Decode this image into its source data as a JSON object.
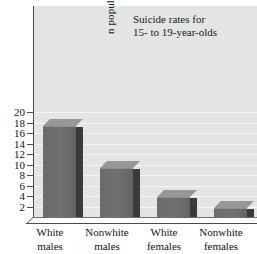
{
  "chart_data": {
    "type": "bar",
    "title": "Suicide rates for 15- to 19-year-olds",
    "title_line1": "Suicide rates for",
    "title_line2": "15- to 19-year-olds",
    "xlabel": "",
    "ylabel": "n population",
    "ylim": [
      0,
      20
    ],
    "ytick_step": 2,
    "grid": true,
    "legend": "none",
    "categories": [
      "White males",
      "Nonwhite males",
      "White females",
      "Nonwhite females"
    ],
    "category_lines": [
      [
        "White",
        "males"
      ],
      [
        "Nonwhite",
        "males"
      ],
      [
        "White",
        "females"
      ],
      [
        "Nonwhite",
        "females"
      ]
    ],
    "values": [
      18.4,
      10.4,
      4.9,
      2.8
    ],
    "ytick_labels": [
      "20",
      "18",
      "16",
      "14",
      "12",
      "10",
      "8",
      "6",
      "4",
      "2"
    ],
    "ytick_values": [
      20,
      18,
      16,
      14,
      12,
      10,
      8,
      6,
      4,
      2
    ]
  },
  "colors": {
    "plot_background": "#e3e5e4",
    "gridline": "#f4f6f5",
    "bar_front": "#6e6e6e",
    "bar_side": "#3a3a3a",
    "bar_top": "#979797",
    "axis": "#4a4a4a",
    "text": "#111111",
    "page_background": "#ffffff"
  }
}
